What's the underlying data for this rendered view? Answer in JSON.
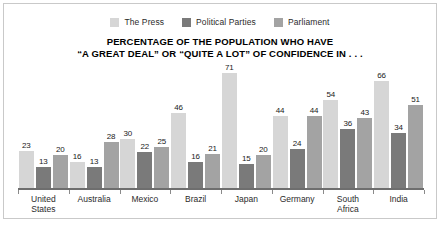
{
  "title": {
    "line1": "PERCENTAGE OF THE POPULATION WHO HAVE",
    "line2": "“A GREAT DEAL” OR “QUITE A LOT” OF CONFIDENCE IN . . ."
  },
  "legend": [
    {
      "label": "The Press",
      "color": "#d6d6d6"
    },
    {
      "label": "Political Parties",
      "color": "#7a7a7a"
    },
    {
      "label": "Parliament",
      "color": "#a3a3a3"
    }
  ],
  "chart_data": {
    "type": "bar",
    "title": "PERCENTAGE OF THE POPULATION WHO HAVE “A GREAT DEAL” OR “QUITE A LOT” OF CONFIDENCE IN . . .",
    "xlabel": "",
    "ylabel": "",
    "ylim": [
      0,
      75
    ],
    "grid": false,
    "legend_position": "top-center",
    "categories": [
      "United States",
      "Australia",
      "Mexico",
      "Brazil",
      "Japan",
      "Germany",
      "South Africa",
      "India"
    ],
    "category_lines": [
      [
        "United",
        "States"
      ],
      [
        "Australia"
      ],
      [
        "Mexico"
      ],
      [
        "Brazil"
      ],
      [
        "Japan"
      ],
      [
        "Germany"
      ],
      [
        "South",
        "Africa"
      ],
      [
        "India"
      ]
    ],
    "series": [
      {
        "name": "The Press",
        "color": "#d6d6d6",
        "values": [
          23,
          16,
          30,
          46,
          71,
          44,
          54,
          66
        ]
      },
      {
        "name": "Political Parties",
        "color": "#7a7a7a",
        "values": [
          13,
          13,
          22,
          16,
          15,
          24,
          36,
          34
        ]
      },
      {
        "name": "Parliament",
        "color": "#a3a3a3",
        "values": [
          20,
          28,
          25,
          21,
          20,
          44,
          43,
          51
        ]
      }
    ]
  }
}
